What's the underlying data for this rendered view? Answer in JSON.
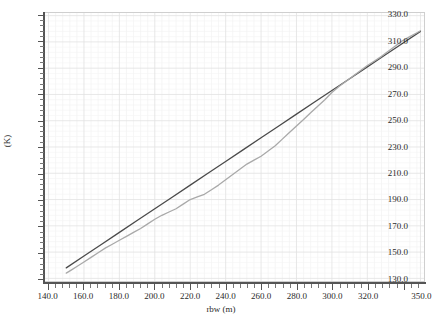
{
  "chart_data": {
    "type": "line",
    "title": "",
    "xlabel": "rbw (m)",
    "ylabel": "(K)",
    "xlim": [
      138,
      352
    ],
    "ylim": [
      128,
      332
    ],
    "grid": true,
    "legend": "none",
    "xticks": [
      140.0,
      160.0,
      180.0,
      200.0,
      220.0,
      240.0,
      260.0,
      280.0,
      300.0,
      320.0,
      350.0
    ],
    "xticklabels": [
      "140.0",
      "160.0",
      "180.0",
      "200.0",
      "220.0",
      "240.0",
      "260.0",
      "280.0",
      "300.0",
      "320.0",
      "350.0"
    ],
    "yticks": [
      130.0,
      150.0,
      170.0,
      190.0,
      210.0,
      230.0,
      250.0,
      270.0,
      290.0,
      310.0,
      330.0
    ],
    "yticklabels": [
      "130.0",
      "150.0",
      "170.0",
      "190.0",
      "210.0",
      "230.0",
      "250.0",
      "270.0",
      "290.0",
      "310.0",
      "330.0"
    ],
    "minor_ticks_per_major_x": 5,
    "minor_ticks_per_major_y": 5,
    "series": [
      {
        "name": "reference-line",
        "color": "#4a4a4a",
        "width": 1.3,
        "x": [
          150.0,
          160.0,
          170.0,
          180.0,
          190.0,
          200.0,
          210.0,
          220.0,
          230.0,
          240.0,
          250.0,
          260.0,
          270.0,
          280.0,
          290.0,
          300.0,
          310.0,
          320.0,
          330.0,
          340.0,
          350.0
        ],
        "y": [
          138.0,
          147.0,
          156.0,
          165.0,
          174.0,
          183.0,
          192.0,
          201.0,
          210.0,
          219.0,
          228.0,
          237.0,
          246.0,
          255.0,
          264.0,
          273.0,
          282.0,
          291.0,
          300.0,
          309.0,
          318.0
        ]
      },
      {
        "name": "measured-curve",
        "color": "#a9a9a9",
        "width": 1.3,
        "x": [
          150.0,
          153.0,
          156.0,
          160.0,
          164.0,
          168.0,
          172.0,
          176.0,
          180.0,
          184.0,
          188.0,
          192.0,
          196.0,
          200.0,
          204.0,
          208.0,
          212.0,
          216.0,
          220.0,
          224.0,
          228.0,
          232.0,
          236.0,
          240.0,
          244.0,
          248.0,
          252.0,
          256.0,
          260.0,
          264.0,
          268.0,
          272.0,
          276.0,
          280.0,
          284.0,
          288.0,
          292.0,
          296.0,
          300.0,
          304.0,
          308.0,
          312.0,
          316.0,
          320.0,
          324.0,
          328.0,
          332.0,
          336.0,
          340.0,
          344.0,
          348.0,
          350.0
        ],
        "y": [
          134.0,
          136.5,
          139.0,
          142.5,
          146.0,
          149.5,
          153.0,
          156.0,
          159.0,
          162.0,
          165.0,
          168.0,
          171.5,
          175.0,
          178.0,
          180.5,
          183.0,
          186.5,
          190.0,
          192.0,
          194.0,
          197.5,
          201.0,
          205.0,
          209.0,
          213.0,
          217.0,
          220.0,
          223.0,
          227.0,
          231.0,
          236.0,
          241.0,
          246.0,
          251.0,
          256.0,
          261.0,
          266.0,
          271.5,
          276.0,
          280.0,
          284.0,
          288.0,
          292.0,
          295.5,
          299.0,
          303.0,
          307.0,
          311.0,
          314.0,
          317.0,
          318.5
        ]
      }
    ]
  }
}
